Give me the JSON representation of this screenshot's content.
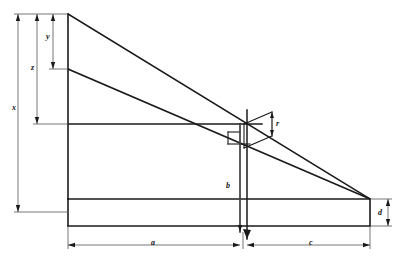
{
  "figure": {
    "type": "engineering-line-drawing",
    "background_color": "#ffffff",
    "line_color": "#1a1a1a",
    "dimension_line_color": "#555555",
    "canvas": {
      "width": 401,
      "height": 269
    }
  },
  "labels": {
    "x": "x",
    "z": "z",
    "y": "y",
    "r": "r",
    "b": "b",
    "a": "a",
    "c": "c",
    "d": "d"
  },
  "dimensions": [
    {
      "name": "x",
      "label": "x",
      "orientation": "vertical",
      "from": [
        18,
        14
      ],
      "to": [
        18,
        212
      ],
      "label_pos": [
        13,
        112
      ]
    },
    {
      "name": "z",
      "label": "z",
      "orientation": "vertical",
      "from": [
        37,
        14
      ],
      "to": [
        37,
        124
      ],
      "label_pos": [
        32,
        70
      ]
    },
    {
      "name": "y",
      "label": "y",
      "orientation": "vertical",
      "from": [
        53,
        14
      ],
      "to": [
        53,
        69
      ],
      "label_pos": [
        47,
        40
      ]
    },
    {
      "name": "r",
      "label": "r",
      "orientation": "vertical",
      "from": [
        272,
        112
      ],
      "to": [
        272,
        136
      ],
      "label_pos": [
        276,
        126
      ]
    },
    {
      "name": "b",
      "label": "b",
      "orientation": "vertical",
      "from": [
        240,
        124
      ],
      "to": [
        240,
        232
      ],
      "label_pos": [
        228,
        188
      ]
    },
    {
      "name": "a",
      "label": "a",
      "orientation": "horizontal",
      "from": [
        68,
        245
      ],
      "to": [
        240,
        245
      ],
      "label_pos": [
        152,
        248
      ]
    },
    {
      "name": "c",
      "label": "c",
      "orientation": "horizontal",
      "from": [
        247,
        245
      ],
      "to": [
        370,
        245
      ],
      "label_pos": [
        311,
        248
      ]
    },
    {
      "name": "d",
      "label": "d",
      "orientation": "vertical",
      "from": [
        388,
        199
      ],
      "to": [
        388,
        226
      ],
      "label_pos": [
        379,
        215
      ]
    }
  ],
  "geometry": {
    "apex_top_left": [
      68,
      14
    ],
    "mid_left": [
      68,
      69
    ],
    "shoulder_left": [
      68,
      124
    ],
    "convergence_right": [
      370,
      199
    ],
    "base_top_left": [
      68,
      199
    ],
    "base_bottom_left": [
      68,
      226
    ],
    "base_bottom_right": [
      370,
      226
    ],
    "center_vertical_x": 240,
    "inner_vertical_x": 247,
    "intersection": [
      248,
      127
    ]
  }
}
